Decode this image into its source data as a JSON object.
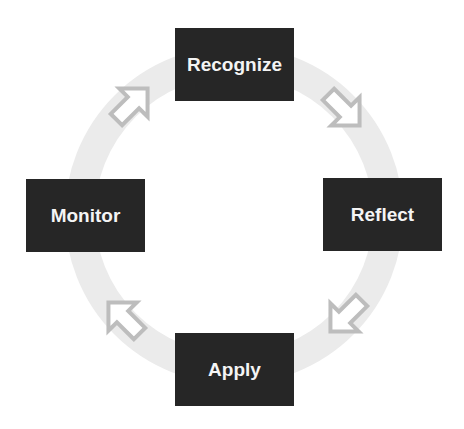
{
  "diagram": {
    "type": "cycle",
    "colors": {
      "box_fill": "#262626",
      "box_text": "#f4f4f4",
      "ring": "#ebebeb",
      "arrow_outline": "#bdbdbd"
    },
    "steps": [
      {
        "label": "Recognize"
      },
      {
        "label": "Reflect"
      },
      {
        "label": "Apply"
      },
      {
        "label": "Monitor"
      }
    ],
    "arrows": [
      {
        "from": "Recognize",
        "to": "Reflect",
        "direction": "down-right"
      },
      {
        "from": "Reflect",
        "to": "Apply",
        "direction": "down-left"
      },
      {
        "from": "Apply",
        "to": "Monitor",
        "direction": "up-left"
      },
      {
        "from": "Monitor",
        "to": "Recognize",
        "direction": "up-right"
      }
    ]
  }
}
